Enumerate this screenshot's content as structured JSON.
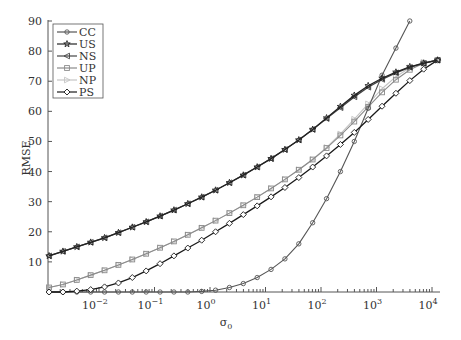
{
  "chart_data": {
    "type": "line",
    "title": "",
    "xlabel": "σ0",
    "ylabel": "RMSE",
    "xscale": "log",
    "xlim": [
      0.0012,
      15000
    ],
    "ylim": [
      0,
      90
    ],
    "x_ticks": [
      "10^-2",
      "10^-1",
      "10^0",
      "10^1",
      "10^2",
      "10^3",
      "10^4"
    ],
    "x_tick_exponents": [
      -2,
      -1,
      0,
      1,
      2,
      3,
      4
    ],
    "y_ticks": [
      10,
      20,
      30,
      40,
      50,
      60,
      70,
      80,
      90
    ],
    "grid": false,
    "legend_position": "upper left",
    "x_log10": [
      -2.9,
      -2.65,
      -2.4,
      -2.15,
      -1.9,
      -1.65,
      -1.4,
      -1.15,
      -0.9,
      -0.65,
      -0.4,
      -0.15,
      0.1,
      0.35,
      0.6,
      0.85,
      1.1,
      1.35,
      1.6,
      1.85,
      2.1,
      2.35,
      2.6,
      2.85,
      3.1,
      3.35,
      3.6,
      3.85,
      4.1
    ],
    "series": [
      {
        "name": "CC",
        "color": "#555555",
        "marker": "circle",
        "values": [
          0,
          0,
          0,
          0,
          0,
          0,
          0,
          0,
          0,
          0,
          0,
          0.2,
          0.6,
          1.5,
          2.8,
          4.8,
          7.5,
          11,
          16,
          23,
          31,
          40,
          50,
          61,
          72,
          81,
          90,
          null,
          null
        ]
      },
      {
        "name": "US",
        "color": "#222222",
        "marker": "star",
        "values": [
          12,
          13.5,
          15,
          16.5,
          18,
          19.7,
          21.5,
          23.3,
          25.2,
          27.2,
          29.3,
          31.5,
          33.8,
          36.3,
          38.8,
          41.5,
          44.3,
          47.3,
          50.5,
          54,
          57.8,
          61.6,
          65.3,
          68.5,
          71,
          73,
          74.8,
          76,
          77
        ]
      },
      {
        "name": "NS",
        "color": "#444444",
        "marker": "triangle-left",
        "values": [
          12,
          13.5,
          15,
          16.5,
          18,
          19.7,
          21.5,
          23.3,
          25.2,
          27.2,
          29.3,
          31.5,
          33.8,
          36.3,
          38.8,
          41.5,
          44.3,
          47.3,
          50.5,
          54,
          57.6,
          61.2,
          64.8,
          68,
          70.6,
          72.8,
          74.6,
          75.9,
          77
        ]
      },
      {
        "name": "UP",
        "color": "#8a8a8a",
        "marker": "square",
        "values": [
          1.5,
          2.5,
          4,
          5.6,
          7.2,
          9,
          10.8,
          12.7,
          14.7,
          16.8,
          19,
          21.3,
          23.7,
          26.2,
          28.8,
          31.5,
          34.4,
          37.4,
          40.6,
          44,
          47.8,
          52,
          56.6,
          61.5,
          66.3,
          70.5,
          73.8,
          76,
          77
        ]
      },
      {
        "name": "NP",
        "color": "#c4c4c4",
        "marker": "triangle-right",
        "values": [
          1.5,
          2.5,
          4,
          5.6,
          7.2,
          9,
          10.8,
          12.7,
          14.7,
          16.8,
          19,
          21.3,
          23.7,
          26.2,
          28.8,
          31.5,
          34.4,
          37.4,
          40.6,
          44,
          48,
          52.5,
          57.4,
          62.5,
          67.5,
          71.5,
          74.5,
          76.3,
          77
        ]
      },
      {
        "name": "PS",
        "color": "#1a1a1a",
        "marker": "diamond",
        "values": [
          0,
          0,
          0.3,
          0.8,
          1.7,
          3,
          4.8,
          7,
          9.4,
          12,
          14.6,
          17.2,
          20,
          22.8,
          25.7,
          28.6,
          31.6,
          34.7,
          38,
          41.5,
          45.2,
          49,
          53,
          57.3,
          61.7,
          66,
          70.2,
          74,
          77
        ]
      }
    ]
  },
  "legend": {
    "entries": [
      "CC",
      "US",
      "NS",
      "UP",
      "NP",
      "PS"
    ]
  },
  "axes": {
    "xlabel_main": "σ",
    "xlabel_sub": "0",
    "ylabel": "RMSE",
    "y_tick_labels": [
      "10",
      "20",
      "30",
      "40",
      "50",
      "60",
      "70",
      "80",
      "90"
    ],
    "x_tick_base": "10",
    "x_tick_exps": [
      "−2",
      "−1",
      "0",
      "1",
      "2",
      "3",
      "4"
    ]
  }
}
